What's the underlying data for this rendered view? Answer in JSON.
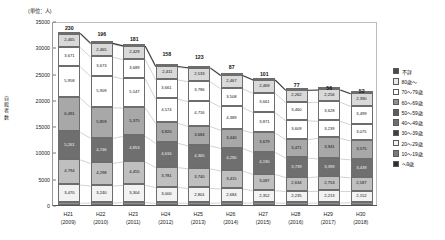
{
  "unit_label": "(単位：人)",
  "yaxis_title": "自殺者数",
  "chart_data": {
    "type": "bar",
    "title": "",
    "subtitle": "",
    "stacked": true,
    "xlabel": "",
    "ylabel": "自殺者数",
    "unit": "(単位：人)",
    "ylim": [
      0,
      35000
    ],
    "ytick_values": [
      0,
      5000,
      10000,
      15000,
      20000,
      25000,
      30000,
      35000
    ],
    "ytick_labels": [
      "0",
      "5000",
      "10000",
      "15000",
      "20000",
      "25000",
      "30000",
      "35000"
    ],
    "grid": false,
    "legend_position": "right",
    "categories": [
      "H21",
      "H22",
      "H23",
      "H24",
      "H25",
      "H26",
      "H27",
      "H28",
      "H29",
      "H30"
    ],
    "category_sublabels": [
      "(2009)",
      "(2010)",
      "(2011)",
      "(2012)",
      "(2013)",
      "(2014)",
      "(2015)",
      "(2016)",
      "(2017)",
      "(2018)"
    ],
    "totals": [
      32845,
      31690,
      30651,
      27858,
      27283,
      25427,
      24025,
      21897,
      21321,
      20840
    ],
    "top_labels": [
      "230",
      "196",
      "181",
      "158",
      "123",
      "87",
      "101",
      "77",
      "56",
      "52"
    ],
    "series": [
      {
        "name": "不詳",
        "color": "#4a4a4a",
        "values": [
          230,
          196,
          181,
          158,
          123,
          87,
          101,
          77,
          56,
          52
        ],
        "labels": [
          "230",
          "196",
          "181",
          "158",
          "123",
          "87",
          "101",
          "77",
          "56",
          "52"
        ],
        "show_inside_label": false
      },
      {
        "name": "80歳～",
        "color": "#d9d9d9",
        "values": [
          2465,
          2465,
          2429,
          2411,
          2533,
          2467,
          2469,
          2262,
          2256,
          2390
        ],
        "labels": [
          "2,465",
          "2,465",
          "2,429",
          "2,411",
          "2,533",
          "2,467",
          "2,469",
          "2,262",
          "2,256",
          "2,390"
        ]
      },
      {
        "name": "70～79歳",
        "color": "#ffffff",
        "values": [
          3671,
          3673,
          3689,
          3661,
          3786,
          3508,
          3661,
          3460,
          3628,
          3499
        ],
        "labels": [
          "3,671",
          "3,673",
          "3,689",
          "3,661",
          "3,786",
          "3,508",
          "3,661",
          "3,460",
          "3,628",
          "3,499"
        ]
      },
      {
        "name": "60～69歳",
        "color": "#ffffff",
        "values": [
          5958,
          5909,
          5547,
          4574,
          4716,
          4389,
          3871,
          3609,
          3239,
          3075
        ],
        "labels": [
          "5,958",
          "5,909",
          "5,547",
          "4,574",
          "4,716",
          "4,389",
          "3,871",
          "3,609",
          "3,239",
          "3,075"
        ]
      },
      {
        "name": "50～59歳",
        "color": "#a8a8a8",
        "values": [
          6491,
          5859,
          5375,
          3820,
          3684,
          3440,
          3679,
          3471,
          3941,
          3575
        ],
        "labels": [
          "6,491",
          "5,859",
          "5,375",
          "3,820",
          "3,684",
          "3,440",
          "3,679",
          "3,471",
          "3,941",
          "3,575"
        ]
      },
      {
        "name": "40～49歳",
        "color": "#6f6f6f",
        "values": [
          5261,
          4746,
          4853,
          4616,
          4365,
          4290,
          4190,
          3739,
          3399,
          3439
        ],
        "labels": [
          "5,261",
          "4,746",
          "4,853",
          "4,616",
          "4,365",
          "4,290",
          "4,190",
          "3,739",
          "3,399",
          "3,439"
        ]
      },
      {
        "name": "30～39歳",
        "color": "#bfbfbf",
        "values": [
          4794,
          4298,
          4455,
          3781,
          3740,
          3415,
          3087,
          2634,
          2753,
          2587
        ],
        "labels": [
          "4,794",
          "4,298",
          "4,455",
          "3,781",
          "3,740",
          "3,415",
          "3,087",
          "2,634",
          "2,753",
          "2,587"
        ]
      },
      {
        "name": "20～29歳",
        "color": "#f2f2f2",
        "values": [
          3470,
          3240,
          3304,
          3000,
          2801,
          2684,
          2352,
          2235,
          2213,
          2152
        ],
        "labels": [
          "3,470",
          "3,240",
          "3,304",
          "3,000",
          "2,801",
          "2,684",
          "2,352",
          "2,235",
          "2,213",
          "2,152"
        ]
      },
      {
        "name": "10～19歳",
        "color": "#8f8f8f",
        "values": [
          505,
          554,
          622,
          520,
          535,
          547,
          554,
          520,
          567,
          599
        ],
        "labels": [
          "",
          "",
          "",
          "",
          "",
          "",
          "",
          "",
          "",
          ""
        ],
        "show_inside_label": false
      },
      {
        "name": "～9歳",
        "color": "#3d3d3d",
        "values": [
          0,
          0,
          0,
          0,
          0,
          0,
          0,
          0,
          0,
          0
        ],
        "labels": [
          "",
          "",
          "",
          "",
          "",
          "",
          "",
          "",
          "",
          ""
        ],
        "show_inside_label": false
      }
    ],
    "legend_entries": [
      {
        "label": "不詳",
        "color": "#4a4a4a"
      },
      {
        "label": "80歳～",
        "color": "#e8e8e8"
      },
      {
        "label": "70～79歳",
        "color": "#ffffff"
      },
      {
        "label": "60～69歳",
        "color": "#909090"
      },
      {
        "label": "50～59歳",
        "color": "#5d5d5d"
      },
      {
        "label": "40～49歳",
        "color": "#6f6f6f"
      },
      {
        "label": "30～39歳",
        "color": "#404040"
      },
      {
        "label": "20～29歳",
        "color": "#f2f2f2"
      },
      {
        "label": "10～19歳",
        "color": "#7a7a7a"
      },
      {
        "label": "～9歳",
        "color": "#2e2e2e"
      }
    ]
  }
}
